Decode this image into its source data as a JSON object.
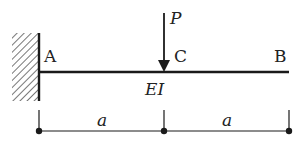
{
  "diagram": {
    "type": "cantilever-beam",
    "labels": {
      "fixed_end": "A",
      "load_point": "C",
      "free_end": "B",
      "load": "P",
      "stiffness": "EI",
      "span_AC": "a",
      "span_CB": "a"
    },
    "colors": {
      "line": "#1a1a1a",
      "hatch": "#555555"
    }
  }
}
